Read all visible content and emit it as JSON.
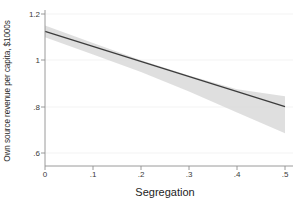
{
  "chart_data": {
    "type": "line",
    "title": "",
    "xlabel": "Segregation",
    "ylabel": "Own source revenue per capita, $1000s",
    "xlim": [
      0,
      0.5
    ],
    "ylim": [
      0.56,
      1.24
    ],
    "xticks": [
      "0",
      ".1",
      ".2",
      ".3",
      ".4",
      ".5"
    ],
    "xtick_values": [
      0,
      0.1,
      0.2,
      0.3,
      0.4,
      0.5
    ],
    "yticks": [
      "1.2",
      "1",
      ".8",
      ".6"
    ],
    "ytick_values": [
      1.2,
      1.0,
      0.8,
      0.6
    ],
    "grid": true,
    "grid_axis": "y",
    "legend": "none",
    "series": [
      {
        "name": "Linear prediction",
        "type": "line",
        "x": [
          0,
          0.5
        ],
        "values": [
          1.125,
          0.8
        ],
        "color": "#3c3c3c"
      },
      {
        "name": "95% confidence interval",
        "type": "band",
        "x": [
          0,
          0.1,
          0.2,
          0.3,
          0.4,
          0.5
        ],
        "upper": [
          1.15,
          1.075,
          1.0,
          0.935,
          0.875,
          0.845
        ],
        "lower": [
          1.1,
          1.025,
          0.95,
          0.865,
          0.775,
          0.685
        ],
        "color": "#d9d9d9"
      }
    ],
    "colors": {
      "line": "#3c3c3c",
      "band": "#d9d9d9",
      "grid": "#f2f2f2",
      "axis": "#9a9a9a",
      "background": "#ffffff",
      "text": "#2b2b2b"
    },
    "annotations": []
  }
}
